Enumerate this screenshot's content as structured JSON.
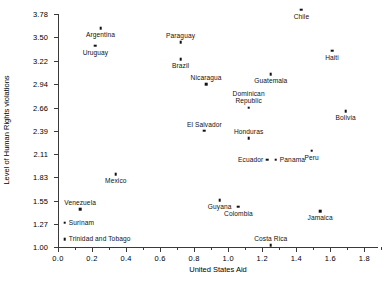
{
  "chart_data": {
    "type": "scatter",
    "title": "",
    "xlabel": "United States Aid",
    "ylabel": "Level of Human Rights violations",
    "xlim": [
      0.0,
      1.88
    ],
    "ylim": [
      1.0,
      3.78
    ],
    "grid": false,
    "legend": "none",
    "xticks": [
      "0.0",
      "0.2",
      "0.4",
      "0.6",
      "0.8",
      "1.0",
      "1.2",
      "1.4",
      "1.6",
      "1.8"
    ],
    "xtick_values": [
      0.0,
      0.2,
      0.4,
      0.6,
      0.8,
      1.0,
      1.2,
      1.4,
      1.6,
      1.8
    ],
    "yticks": [
      "3.78",
      "3.50",
      "3.22",
      "2.94",
      "2.66",
      "2.39",
      "2.11",
      "1.83",
      "1.55",
      "1.27",
      "1.00"
    ],
    "ytick_values": [
      3.78,
      3.5,
      3.22,
      2.94,
      2.66,
      2.39,
      2.11,
      1.83,
      1.55,
      1.27,
      1.0
    ],
    "points": [
      {
        "label": "Argentina",
        "x": 0.25,
        "y": 3.61,
        "pos": "below"
      },
      {
        "label": "Uruguay",
        "x": 0.22,
        "y": 3.4,
        "pos": "below"
      },
      {
        "label": "Paraguay",
        "x": 0.72,
        "y": 3.44,
        "pos": "above"
      },
      {
        "label": "Brazil",
        "x": 0.72,
        "y": 3.24,
        "pos": "below"
      },
      {
        "label": "Chile",
        "x": 1.43,
        "y": 3.83,
        "pos": "below"
      },
      {
        "label": "Haiti",
        "x": 1.61,
        "y": 3.34,
        "pos": "below"
      },
      {
        "label": "Nicaragua",
        "x": 0.87,
        "y": 2.94,
        "pos": "above"
      },
      {
        "label": "Guatemala",
        "x": 1.25,
        "y": 3.06,
        "pos": "below"
      },
      {
        "label": "Dominican Republic",
        "x": 1.12,
        "y": 2.66,
        "pos": "above"
      },
      {
        "label": "Bolivia",
        "x": 1.69,
        "y": 2.62,
        "pos": "below"
      },
      {
        "label": "El Salvador",
        "x": 0.86,
        "y": 2.39,
        "pos": "above"
      },
      {
        "label": "Honduras",
        "x": 1.12,
        "y": 2.3,
        "pos": "above"
      },
      {
        "label": "Peru",
        "x": 1.49,
        "y": 2.15,
        "pos": "below"
      },
      {
        "label": "Ecuador",
        "x": 1.23,
        "y": 2.04,
        "pos": "left"
      },
      {
        "label": "Panama",
        "x": 1.28,
        "y": 2.04,
        "pos": "right"
      },
      {
        "label": "Mexico",
        "x": 0.34,
        "y": 1.87,
        "pos": "below"
      },
      {
        "label": "Venezuela",
        "x": 0.13,
        "y": 1.45,
        "pos": "above"
      },
      {
        "label": "Guyana",
        "x": 0.95,
        "y": 1.56,
        "pos": "below"
      },
      {
        "label": "Colombia",
        "x": 1.06,
        "y": 1.48,
        "pos": "below"
      },
      {
        "label": "Jamaica",
        "x": 1.54,
        "y": 1.43,
        "pos": "below"
      },
      {
        "label": "Surinam",
        "x": 0.04,
        "y": 1.29,
        "pos": "right"
      },
      {
        "label": "Trinidad and Tobago",
        "x": 0.04,
        "y": 1.09,
        "pos": "right"
      },
      {
        "label": "Costa Rica",
        "x": 1.25,
        "y": 1.02,
        "pos": "above"
      }
    ]
  }
}
